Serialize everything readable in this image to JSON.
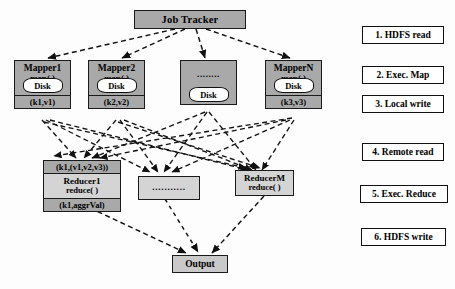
{
  "diagram": {
    "colors": {
      "node_fill": "#a9a9a9",
      "reducer_fill": "#d4d4d4",
      "output_fill": "#c9c9c9",
      "disk_fill": "#ffffff",
      "stroke": "#1a1a1a",
      "background": "#fdfdfd"
    }
  },
  "job_tracker": {
    "label": "Job Tracker"
  },
  "mappers": [
    {
      "name": "Mapper1",
      "fn": "map( )",
      "disk": "Disk",
      "kv": "(k1,v1)",
      "is_ellipsis": false
    },
    {
      "name": "Mapper2",
      "fn": "map( )",
      "disk": "Disk",
      "kv": "(k2,v2)",
      "is_ellipsis": false
    },
    {
      "name": "........",
      "fn": "",
      "disk": "Disk",
      "kv": "",
      "is_ellipsis": true
    },
    {
      "name": "MapperN",
      "fn": "map( )",
      "disk": "Disk",
      "kv": "(k3,v3)",
      "is_ellipsis": false
    }
  ],
  "reducers": [
    {
      "input_kv": "(k1,(v1,v2,v3))",
      "name": "Reducer1",
      "fn": "reduce( )",
      "output_kv": "(k1,aggrVal)",
      "is_ellipsis": false
    },
    {
      "input_kv": "",
      "name": "...........",
      "fn": "",
      "output_kv": "",
      "is_ellipsis": true
    },
    {
      "input_kv": "",
      "name": "ReducerM",
      "fn": "reduce( )",
      "output_kv": "",
      "is_ellipsis": false
    }
  ],
  "output": {
    "label": "Output"
  },
  "legend": [
    {
      "label": "1. HDFS read"
    },
    {
      "label": "2. Exec. Map"
    },
    {
      "label": "3. Local write"
    },
    {
      "label": "4. Remote read"
    },
    {
      "label": "5. Exec. Reduce"
    },
    {
      "label": "6. HDFS write"
    }
  ]
}
